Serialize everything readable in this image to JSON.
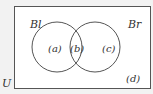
{
  "diagram": {
    "type": "venn",
    "universe_label": "U",
    "sets": [
      {
        "name": "Bl",
        "label": "Bl"
      },
      {
        "name": "Br",
        "label": "Br"
      }
    ],
    "regions": {
      "a": "(a)",
      "b": "(b)",
      "c": "(c)",
      "d": "(d)"
    },
    "colors": {
      "background": "#f2f2f2",
      "box_fill": "#ffffff",
      "stroke": "#555555"
    }
  }
}
